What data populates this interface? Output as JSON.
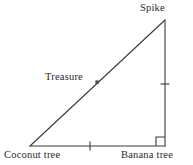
{
  "figure": {
    "type": "geometry-diagram",
    "shape": "right-triangle",
    "background_color": "#ffffff",
    "stroke_color": "#3a3a3a",
    "text_color": "#2b2b2b"
  },
  "labels": {
    "spike": "Spike",
    "treasure": "Treasure",
    "coconut_tree": "Coconut tree",
    "banana_tree": "Banana tree"
  },
  "vertices": [
    {
      "name": "coconut-tree",
      "label": "Coconut tree",
      "x": 30,
      "y": 146
    },
    {
      "name": "banana-tree",
      "label": "Banana tree",
      "x": 165,
      "y": 146
    },
    {
      "name": "spike",
      "label": "Spike",
      "x": 165,
      "y": 20
    }
  ],
  "sides": [
    {
      "name": "base",
      "from": "coconut-tree",
      "to": "banana-tree",
      "tick_marks": 1
    },
    {
      "name": "vertical-leg",
      "from": "banana-tree",
      "to": "spike",
      "tick_marks": 1
    },
    {
      "name": "hypotenuse",
      "from": "coconut-tree",
      "to": "spike",
      "tick_marks": 0,
      "label": "Treasure"
    }
  ],
  "markers": {
    "right_angle": {
      "at": "banana-tree",
      "size": 9
    },
    "base_tick": {
      "x": 90,
      "y": 146,
      "orientation": "vertical",
      "length": 9
    },
    "leg_tick": {
      "x": 165,
      "y": 84,
      "orientation": "horizontal",
      "length": 9
    },
    "treasure_point": {
      "x": 97,
      "y": 82,
      "size": 3.2,
      "filled": true
    }
  }
}
